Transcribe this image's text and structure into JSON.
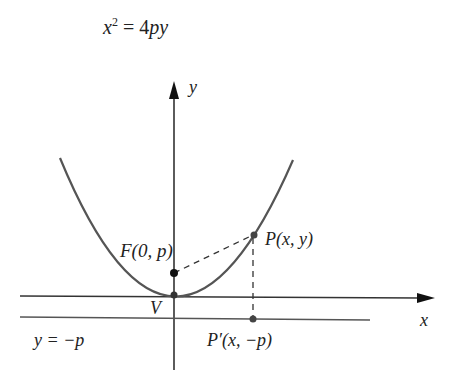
{
  "title": {
    "eq_base": "x",
    "eq_exp": "2",
    "eq_rest": " = 4",
    "eq_var": "py"
  },
  "labels": {
    "y_axis": "y",
    "x_axis": "x",
    "focus": "F(0, p)",
    "vertex": "V",
    "point": "P(x, y)",
    "directrix": "y = −p",
    "projection": "P′(x, −p)"
  },
  "colors": {
    "curve": "#555555",
    "axis": "#333333",
    "point": "#222222"
  }
}
